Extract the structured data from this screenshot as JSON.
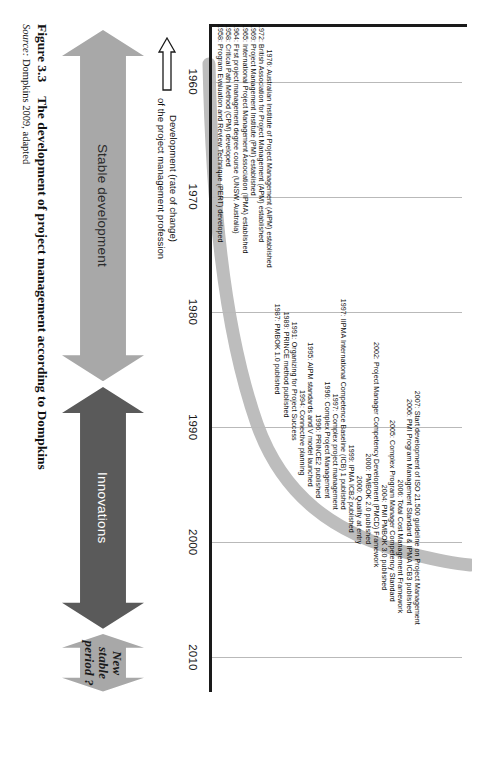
{
  "figure": {
    "caption_number": "Figure 3.3",
    "caption_title": "The development of project management according to Dompkins",
    "source_label": "Source:",
    "source_text": "Dompkins 2009, adapted"
  },
  "axis": {
    "y_label_line1": "Development (rate of change)",
    "y_label_line2": "of the project management profession",
    "years": [
      "1960",
      "1970",
      "1980",
      "1990",
      "2000",
      "2010"
    ],
    "x_min": 1955,
    "x_max": 2013
  },
  "bands": [
    {
      "label": "Stable development",
      "start": 1955.5,
      "end": 1986.0,
      "color": "#a8a8a8",
      "text_style": "light"
    },
    {
      "label": "Innovations",
      "start": 1986.5,
      "end": 2007.5,
      "color": "#5a5a5a",
      "text_style": "dark"
    },
    {
      "label": "New stable period ?",
      "start": 2008.0,
      "end": 2013.0,
      "color": "#a8a8a8",
      "text_style": "italic"
    }
  ],
  "events": [
    {
      "year": 1958,
      "text": "1958: Program Evaluation and Review Technique (PERT) developed"
    },
    {
      "year": 1958,
      "text": "1958: Critical Path Method (CPM) developed"
    },
    {
      "year": 1964,
      "text": "1964: First project management degree course (UNSW, Australia)"
    },
    {
      "year": 1965,
      "text": "1965: International Project Management Association (IPMA) established"
    },
    {
      "year": 1969,
      "text": "1969: Project Management Institute (PMI) established"
    },
    {
      "year": 1972,
      "text": "1972: British Association for Project Management (APM) established"
    },
    {
      "year": 1976,
      "text": "1976: Australian Institute of Project Management (AIPM) established"
    },
    {
      "year": 1987,
      "text": "1987: PMBOK 1.0 published"
    },
    {
      "year": 1989,
      "text": "1989: PRINCE method published"
    },
    {
      "year": 1991,
      "text": "1991: Organizing for Project Success"
    },
    {
      "year": 1994,
      "text": "1994: Connective planning"
    },
    {
      "year": 1995,
      "text": "1995: AIPM standards and  V model launched"
    },
    {
      "year": 1996,
      "text": "1996: PRINCE2 published"
    },
    {
      "year": 1996,
      "text": "1996: Complex Project Management"
    },
    {
      "year": 1997,
      "text": "1997: Complex project management"
    },
    {
      "year": 1997,
      "text": "1997: IIPMA International Competence Baseline (ICB) 1 published"
    },
    {
      "year": 1999,
      "text": "1999: IPMA ICB2 published"
    },
    {
      "year": 2000,
      "text": "2000: Quality at entry"
    },
    {
      "year": 2000,
      "text": "2000: PMBOK 2.0 published"
    },
    {
      "year": 2002,
      "text": "2002: Project Manager Competency Development (PMCD) Framework"
    },
    {
      "year": 2004,
      "text": "2004: PMI PMBOK 3.0 published"
    },
    {
      "year": 2005,
      "text": "2005: Complex Program Manager Competency Standard"
    },
    {
      "year": 2006,
      "text": "2006: Total Cost Management Framework"
    },
    {
      "year": 2006,
      "text": "2006: PMI Program Management Standard & IPMA ICB3 published"
    },
    {
      "year": 2007,
      "text": "2007: Start development of ISO 21.500 guideline on Project Management"
    }
  ],
  "chart_data": {
    "type": "line",
    "title": "The development of project management according to Dompkins",
    "xlabel": "",
    "ylabel": "Development (rate of change) of the project management profession",
    "xlim": [
      1955,
      2013
    ],
    "x": [
      1958,
      1965,
      1972,
      1980,
      1987,
      1992,
      1996,
      2000,
      2003,
      2005,
      2007,
      2008
    ],
    "values": [
      2,
      4,
      7,
      12,
      20,
      31,
      44,
      60,
      72,
      82,
      92,
      100
    ],
    "series": [
      {
        "name": "Development (rate of change) of the project management profession",
        "values": [
          2,
          4,
          7,
          12,
          20,
          31,
          44,
          60,
          72,
          82,
          92,
          100
        ]
      }
    ],
    "grid": true,
    "legend": "none"
  }
}
